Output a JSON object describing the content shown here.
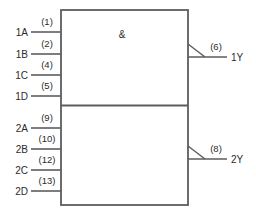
{
  "diagram": {
    "qualifier": "&",
    "line_color": "#5d5d5d",
    "text_color": "#2b2b2b",
    "background": "#ffffff"
  },
  "gate1": {
    "inputs": [
      {
        "name": "1A",
        "pin": "(1)"
      },
      {
        "name": "1B",
        "pin": "(2)"
      },
      {
        "name": "1C",
        "pin": "(4)"
      },
      {
        "name": "1D",
        "pin": "(5)"
      }
    ],
    "output": {
      "name": "1Y",
      "pin": "(6)"
    }
  },
  "gate2": {
    "inputs": [
      {
        "name": "2A",
        "pin": "(9)"
      },
      {
        "name": "2B",
        "pin": "(10)"
      },
      {
        "name": "2C",
        "pin": "(12)"
      },
      {
        "name": "2D",
        "pin": "(13)"
      }
    ],
    "output": {
      "name": "2Y",
      "pin": "(8)"
    }
  }
}
